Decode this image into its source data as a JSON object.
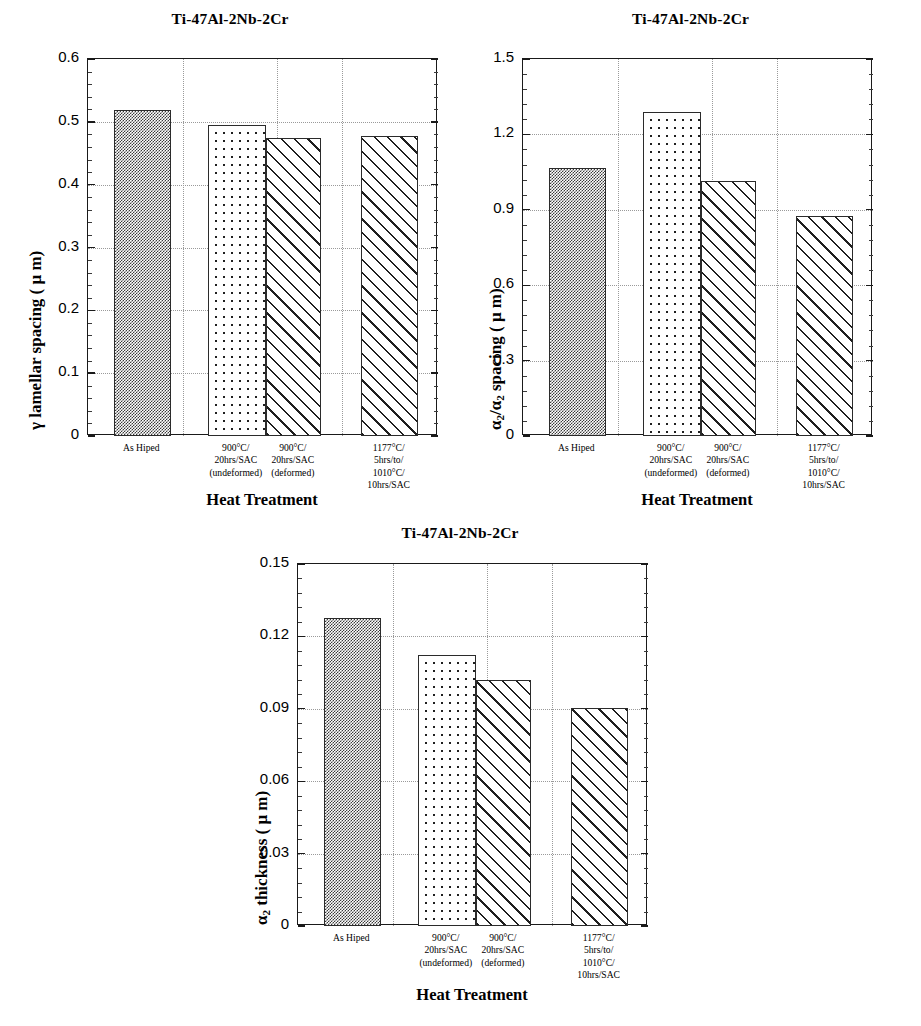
{
  "figure": {
    "caption_shared_xlabel": "Heat Treatment",
    "category_labels": [
      "As Hiped",
      "900°C/\n20hrs/SAC\n(undeformed)",
      "900°C/\n20hrs/SAC\n(deformed)",
      "1177°C/\n5hrs/to/\n1010°C/\n10hrs/SAC"
    ]
  },
  "charts": [
    {
      "id": "gamma-lamellar-spacing",
      "title": "Ti-47Al-2Nb-2Cr",
      "ylabel_prefix": "γ",
      "ylabel_main": " lamellar spacing (  μ m)",
      "xlabel": "Heat Treatment",
      "yticks": [
        "0",
        "0.1",
        "0.2",
        "0.3",
        "0.4",
        "0.5",
        "0.6"
      ]
    },
    {
      "id": "alpha2-alpha2-spacing",
      "title": "Ti-47Al-2Nb-2Cr",
      "ylabel_prefix": "α",
      "ylabel_sub": "2",
      "ylabel_mid": "/α",
      "ylabel_sub2": "2",
      "ylabel_main": "  spacing (  μ m)",
      "xlabel": "Heat Treatment",
      "yticks": [
        "0",
        "0.3",
        "0.6",
        "0.9",
        "1.2",
        "1.5"
      ]
    },
    {
      "id": "alpha2-thickness",
      "title": "Ti-47Al-2Nb-2Cr",
      "ylabel_prefix": "α",
      "ylabel_sub": "2",
      "ylabel_main": "  thickness (  μ m)",
      "xlabel": "Heat Treatment",
      "yticks": [
        "0",
        "0.03",
        "0.06",
        "0.09",
        "0.12",
        "0.15"
      ]
    }
  ],
  "chart_data": [
    {
      "type": "bar",
      "title": "Ti-47Al-2Nb-2Cr",
      "xlabel": "Heat Treatment",
      "ylabel": "γ lamellar spacing ( μm)",
      "categories": [
        "As Hiped",
        "900°C/20hrs/SAC (undeformed)",
        "900°C/20hrs/SAC (deformed)",
        "1177°C/5hrs/to/1010°C/10hrs/SAC"
      ],
      "values": [
        0.519,
        0.495,
        0.474,
        0.478
      ],
      "ylim": [
        0,
        0.6
      ],
      "ytick_values": [
        0,
        0.1,
        0.2,
        0.3,
        0.4,
        0.5,
        0.6
      ],
      "grid": true,
      "legend": "none",
      "bar_fills": [
        "checker",
        "dots",
        "hatch",
        "hatch"
      ]
    },
    {
      "type": "bar",
      "title": "Ti-47Al-2Nb-2Cr",
      "xlabel": "Heat Treatment",
      "ylabel": "α2/α2 spacing ( μm)",
      "categories": [
        "As Hiped",
        "900°C/20hrs/SAC (undeformed)",
        "900°C/20hrs/SAC (deformed)",
        "1177°C/5hrs/to/1010°C/10hrs/SAC"
      ],
      "values": [
        1.065,
        1.29,
        1.015,
        0.875
      ],
      "ylim": [
        0,
        1.5
      ],
      "ytick_values": [
        0,
        0.3,
        0.6,
        0.9,
        1.2,
        1.5
      ],
      "grid": true,
      "legend": "none",
      "bar_fills": [
        "checker",
        "dots",
        "hatch",
        "hatch"
      ]
    },
    {
      "type": "bar",
      "title": "Ti-47Al-2Nb-2Cr",
      "xlabel": "Heat Treatment",
      "ylabel": "α2 thickness ( μm)",
      "categories": [
        "As Hiped",
        "900°C/20hrs/SAC (undeformed)",
        "900°C/20hrs/SAC (deformed)",
        "1177°C/5hrs/to/1010°C/10hrs/SAC"
      ],
      "values": [
        0.1275,
        0.1125,
        0.102,
        0.0905
      ],
      "ylim": [
        0,
        0.15
      ],
      "ytick_values": [
        0,
        0.03,
        0.06,
        0.09,
        0.12,
        0.15
      ],
      "grid": true,
      "legend": "none",
      "bar_fills": [
        "checker",
        "dots",
        "hatch",
        "hatch"
      ]
    }
  ]
}
